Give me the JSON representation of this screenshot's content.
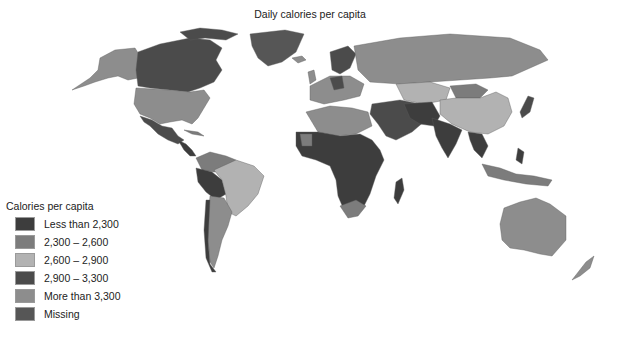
{
  "title": "Daily calories per capita",
  "legend": {
    "title": "Calories per capita",
    "items": [
      {
        "label": "Less than 2,300",
        "color": "#3d3d3d"
      },
      {
        "label": "2,300 – 2,600",
        "color": "#7c7c7c"
      },
      {
        "label": "2,600 – 2,900",
        "color": "#b2b2b2"
      },
      {
        "label": "2,900 – 3,300",
        "color": "#4b4b4b"
      },
      {
        "label": "More than 3,300",
        "color": "#8d8d8d"
      },
      {
        "label": "Missing",
        "color": "#565656"
      }
    ]
  },
  "regions": [
    {
      "name": "Canada",
      "category": "2,900 – 3,300"
    },
    {
      "name": "Alaska (USA)",
      "category": "More than 3,300"
    },
    {
      "name": "United States",
      "category": "More than 3,300"
    },
    {
      "name": "Greenland",
      "category": "Missing"
    },
    {
      "name": "Mexico",
      "category": "2,900 – 3,300"
    },
    {
      "name": "Central America",
      "category": "Less than 2,300"
    },
    {
      "name": "Brazil",
      "category": "2,600 – 2,900"
    },
    {
      "name": "Argentina",
      "category": "More than 3,300"
    },
    {
      "name": "Bolivia / Peru",
      "category": "Less than 2,300"
    },
    {
      "name": "Colombia / Venezuela",
      "category": "2,300 – 2,600"
    },
    {
      "name": "Western Europe",
      "category": "More than 3,300"
    },
    {
      "name": "Scandinavia",
      "category": "2,900 – 3,300"
    },
    {
      "name": "Russia",
      "category": "More than 3,300"
    },
    {
      "name": "Central Asia",
      "category": "2,600 – 2,900"
    },
    {
      "name": "China",
      "category": "2,600 – 2,900"
    },
    {
      "name": "Mongolia",
      "category": "2,300 – 2,600"
    },
    {
      "name": "Middle East",
      "category": "2,900 – 3,300"
    },
    {
      "name": "India",
      "category": "Less than 2,300"
    },
    {
      "name": "Southeast Asia",
      "category": "Less than 2,300"
    },
    {
      "name": "Japan",
      "category": "2,900 – 3,300"
    },
    {
      "name": "North Africa",
      "category": "More than 3,300"
    },
    {
      "name": "Sub-Saharan Africa",
      "category": "Less than 2,300"
    },
    {
      "name": "South Africa",
      "category": "2,300 – 2,600"
    },
    {
      "name": "Madagascar",
      "category": "Less than 2,300"
    },
    {
      "name": "Indonesia",
      "category": "2,300 – 2,600"
    },
    {
      "name": "Australia",
      "category": "More than 3,300"
    },
    {
      "name": "New Zealand",
      "category": "More than 3,300"
    }
  ]
}
